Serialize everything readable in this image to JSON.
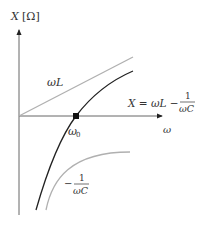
{
  "axes": {
    "y_label_var": "X",
    "y_label_unit": "[Ω]",
    "x_label": "ω"
  },
  "curves": {
    "inductive": {
      "label": "ωL",
      "color": "#b0b0b0"
    },
    "total": {
      "label_lhs": "X = ωL −",
      "label_num": "1",
      "label_den": "ωC",
      "color": "#222222"
    },
    "capacitive": {
      "label_sign": "−",
      "label_num": "1",
      "label_den": "ωC",
      "color": "#b0b0b0"
    }
  },
  "points": {
    "resonance": {
      "label": "ω",
      "subscript": "0"
    }
  },
  "colors": {
    "axis": "#444444",
    "text": "#333333"
  }
}
